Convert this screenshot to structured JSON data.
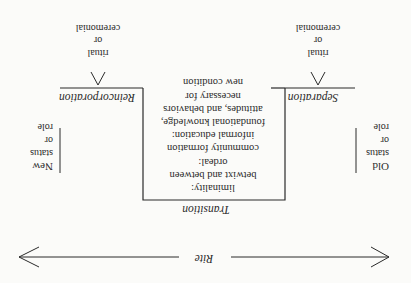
{
  "diagram": {
    "title": "Rite",
    "orientation": "rotated 180 degrees",
    "center_phase": {
      "label": "Transition",
      "lines": [
        "liminality:",
        "betwixt and between",
        "ordeal:",
        "community formation",
        "informal education:",
        "foundational knowledge,",
        "attitudes, and behaviors",
        "necessary for",
        "new condition"
      ]
    },
    "left_phase": {
      "label": "Separation",
      "marker_lines": [
        "ritual",
        "or",
        "ceremonial"
      ]
    },
    "right_phase": {
      "label": "Reincorporation",
      "marker_lines": [
        "ritual",
        "or",
        "ceremonial"
      ]
    },
    "start_state": {
      "lines": [
        "Old",
        "status",
        "or",
        "role"
      ]
    },
    "end_state": {
      "lines": [
        "New",
        "status",
        "or",
        "role"
      ]
    },
    "colors": {
      "ink": "#2a2a2a",
      "paper": "#fbfbf9"
    }
  }
}
